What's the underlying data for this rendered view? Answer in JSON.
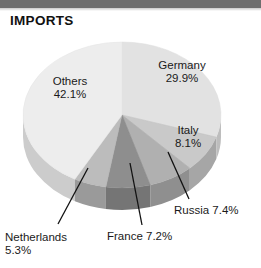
{
  "header": {
    "title": "IMPORTS"
  },
  "chart_data": {
    "type": "pie",
    "title": "IMPORTS",
    "xlabel": "",
    "ylabel": "",
    "legend_position": "none",
    "grid": false,
    "units": "percent",
    "categories": [
      "Germany",
      "Italy",
      "Russia",
      "France",
      "Netherlands",
      "Others"
    ],
    "values": [
      29.9,
      8.1,
      7.4,
      7.2,
      5.3,
      42.1
    ],
    "slices": [
      {
        "name": "Germany",
        "value": 29.9,
        "label": "Germany",
        "value_label": "29.9%",
        "color": "#e2e2e2",
        "side_color": "#bdbdbd",
        "label_placement": "inside"
      },
      {
        "name": "Italy",
        "value": 8.1,
        "label": "Italy",
        "value_label": "8.1%",
        "color": "#c9c9c9",
        "side_color": "#a6a6a6",
        "label_placement": "inside"
      },
      {
        "name": "Russia",
        "value": 7.4,
        "label": "Russia",
        "value_label": "7.4%",
        "color": "#b0b0b0",
        "side_color": "#8f8f8f",
        "label_placement": "outside"
      },
      {
        "name": "France",
        "value": 7.2,
        "label": "France",
        "value_label": "7.2%",
        "color": "#8e8e8e",
        "side_color": "#757575",
        "label_placement": "outside"
      },
      {
        "name": "Netherlands",
        "value": 5.3,
        "label": "Netherlands",
        "value_label": "5.3%",
        "color": "#bcbcbc",
        "side_color": "#9a9a9a",
        "label_placement": "outside"
      },
      {
        "name": "Others",
        "value": 42.1,
        "label": "Others",
        "value_label": "42.1%",
        "color": "#ededed",
        "side_color": "#cccccc",
        "label_placement": "inside"
      }
    ],
    "labels": {
      "germany_name": "Germany",
      "germany_value": "29.9%",
      "italy_name": "Italy",
      "italy_value": "8.1%",
      "russia_text": "Russia 7.4%",
      "france_text": "France 7.2%",
      "netherlands_name": "Netherlands",
      "netherlands_value": "5.3%",
      "others_name": "Others",
      "others_value": "42.1%"
    }
  },
  "colors": {
    "top_band": "#6e6e6e",
    "text": "#1a1a1a",
    "background": "#ffffff",
    "leader_line": "#111111"
  }
}
